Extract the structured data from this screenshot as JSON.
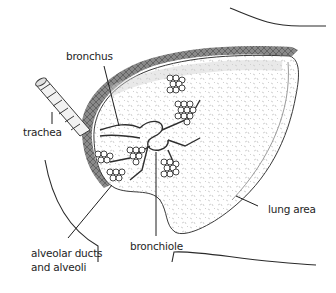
{
  "figure": {
    "type": "anatomical-illustration",
    "subject": "lung",
    "labels": {
      "bronchus": "bronchus",
      "trachea": "trachea",
      "alveolar_line1": "alveolar ducts",
      "alveolar_line2": "and alveoli",
      "bronchiole": "bronchiole",
      "lung_area": "lung area"
    },
    "colors": {
      "ink": "#1e1e1e",
      "pleura": "#7a7a7a",
      "stipple": "#b5b5b5",
      "background": "#ffffff"
    }
  }
}
